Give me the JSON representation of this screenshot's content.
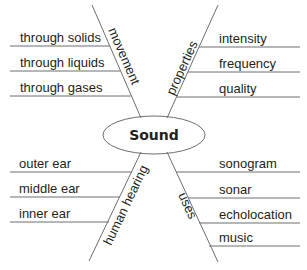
{
  "center": {
    "label": "Sound"
  },
  "branches": [
    {
      "id": "movement",
      "label": "movement",
      "items": [
        "through solids",
        "through liquids",
        "through gases"
      ]
    },
    {
      "id": "properties",
      "label": "properties",
      "items": [
        "intensity",
        "frequency",
        "quality"
      ]
    },
    {
      "id": "human-hearing",
      "label": "human hearing",
      "items": [
        "outer ear",
        "middle ear",
        "inner ear"
      ]
    },
    {
      "id": "uses",
      "label": "uses",
      "items": [
        "sonogram",
        "sonar",
        "echolocation",
        "music"
      ]
    }
  ],
  "colors": {
    "line": "#6d6e71",
    "text": "#231f20",
    "background": "#ffffff"
  }
}
